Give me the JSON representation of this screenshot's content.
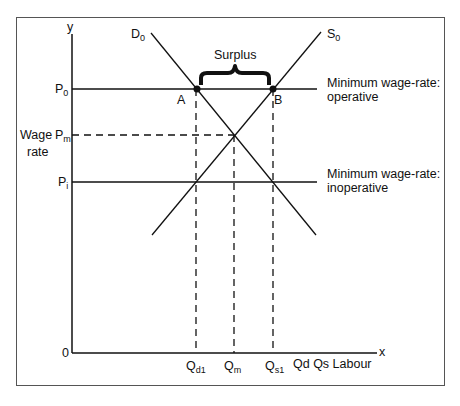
{
  "diagram": {
    "type": "labour-market minimum wage diagram",
    "axes": {
      "y_label": "y",
      "x_label": "x",
      "origin_label": "0",
      "y_title_line1": "Wage",
      "y_title_line2": "rate",
      "x_title": "Qd Qs Labour"
    },
    "price_levels": {
      "p0": {
        "base": "P",
        "sub": "0"
      },
      "pm": {
        "base": "P",
        "sub": "m"
      },
      "pi": {
        "base": "P",
        "sub": "i"
      }
    },
    "quantities": {
      "qd1": {
        "base": "Q",
        "sub": "d1"
      },
      "qm": {
        "base": "Q",
        "sub": "m"
      },
      "qs1": {
        "base": "Q",
        "sub": "s1"
      }
    },
    "curves": {
      "demand": {
        "base": "D",
        "sub": "0"
      },
      "supply": {
        "base": "S",
        "sub": "0"
      }
    },
    "points": {
      "a": "A",
      "b": "B"
    },
    "annotations": {
      "surplus": "Surplus",
      "operative_line1": "Minimum wage-rate:",
      "operative_line2": "operative",
      "inoperative_line1": "Minimum wage-rate:",
      "inoperative_line2": "inoperative"
    },
    "colors": {
      "line": "#111111",
      "frame": "#555555",
      "background": "#ffffff"
    }
  }
}
